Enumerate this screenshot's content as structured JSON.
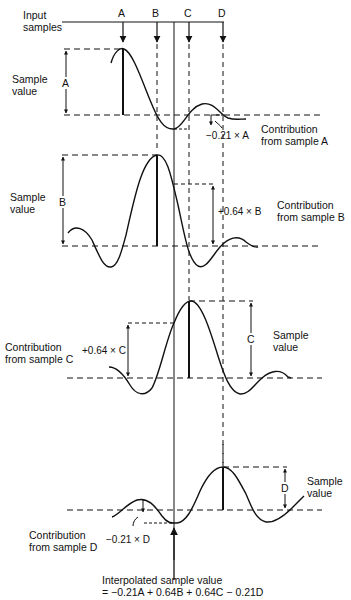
{
  "diagram": {
    "header": {
      "input_samples_label": "Input\nsamples",
      "input_samples_line1": "Input",
      "input_samples_line2": "samples",
      "sample_letters": [
        "A",
        "B",
        "C",
        "D"
      ]
    },
    "panels": [
      {
        "id": "A",
        "side_label_line1": "Sample",
        "side_label_line2": "value",
        "dimension_letter": "A",
        "contribution_value": "−0.21 × A",
        "contribution_label_line1": "Contribution",
        "contribution_label_line2": "from sample A"
      },
      {
        "id": "B",
        "side_label_line1": "Sample",
        "side_label_line2": "value",
        "dimension_letter": "B",
        "contribution_value": "+0.64 × B",
        "contribution_label_line1": "Contribution",
        "contribution_label_line2": "from sample B"
      },
      {
        "id": "C",
        "side_label_line1": "Sample",
        "side_label_line2": "value",
        "dimension_letter": "C",
        "contribution_value": "+0.64 × C",
        "contribution_label_line1": "Contribution",
        "contribution_label_line2": "from sample C"
      },
      {
        "id": "D",
        "side_label_line1": "Sample",
        "side_label_line2": "value",
        "dimension_letter": "D",
        "contribution_value": "−0.21 × D",
        "contribution_label_line1": "Contribution",
        "contribution_label_line2": "from sample D"
      }
    ],
    "result": {
      "line1": "Interpolated sample value",
      "line2": "= −0.21A + 0.64B + 0.64C − 0.21D"
    },
    "weights": {
      "A": -0.21,
      "B": 0.64,
      "C": 0.64,
      "D": -0.21
    },
    "colors": {
      "ink": "#111111",
      "background": "#ffffff"
    }
  }
}
